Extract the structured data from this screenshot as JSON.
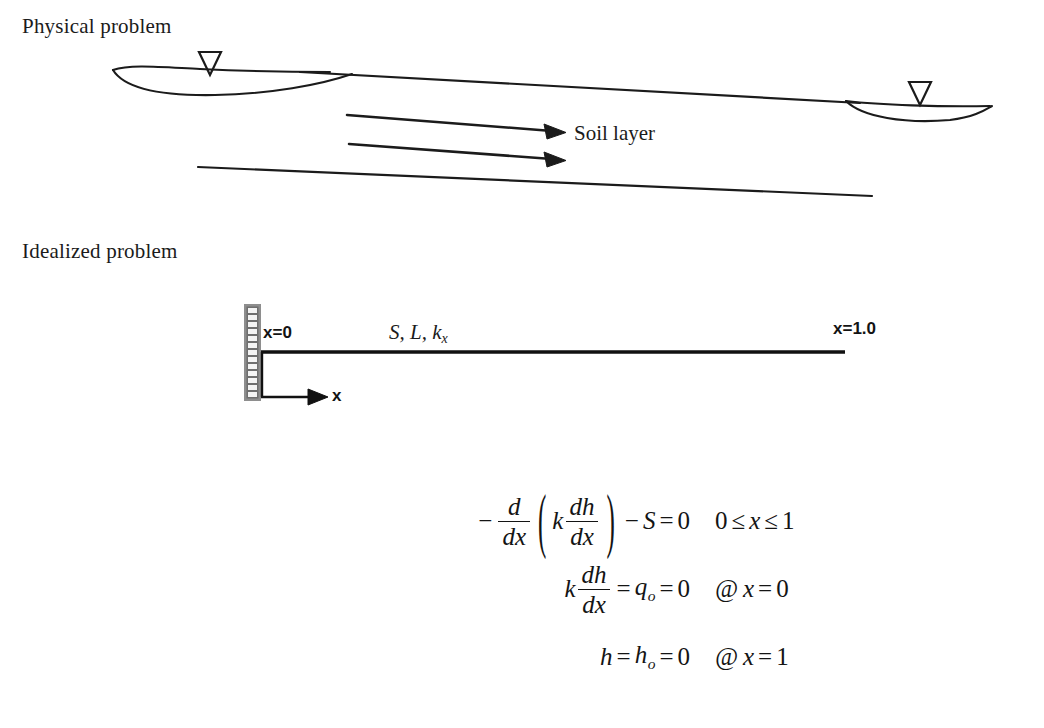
{
  "page": {
    "background": "#ffffff",
    "ink": "#1b1b1b",
    "width": 1044,
    "height": 728
  },
  "sections": {
    "physical": {
      "title": "Physical problem",
      "soil_layer_label": "Soil layer",
      "water_table_icon_left": "water-table-icon",
      "water_table_icon_right": "water-table-icon",
      "flow_arrow_count": 2
    },
    "idealized": {
      "title": "Idealized problem",
      "left_boundary_label": "x=0",
      "right_boundary_label": "x=1.0",
      "axis_label": "x",
      "beam_properties": {
        "base": "S, L, k",
        "subscript": "x"
      },
      "wall_icon": "hatched-fixed-support-icon",
      "wall_cells": 13,
      "wall_color": "#8a8a8a",
      "wall_cell_color": "#f2f2f2"
    }
  },
  "equations": [
    {
      "id": "governing-equation",
      "parts": {
        "minus": "−",
        "frac1_num": "d",
        "frac1_den": "dx",
        "paren_open": "(",
        "k": "k",
        "frac2_num": "dh",
        "frac2_den": "dx",
        "paren_close": ")",
        "minus2": "−",
        "S": "S",
        "equals": "=",
        "zero": "0"
      },
      "condition": {
        "text": "0 ≤ x ≤ 1",
        "lower": "0",
        "le1": "≤",
        "var": "x",
        "le2": "≤",
        "upper": "1"
      }
    },
    {
      "id": "neumann-boundary-condition",
      "parts": {
        "k": "k",
        "frac_num": "dh",
        "frac_den": "dx",
        "equals1": "=",
        "q": "q",
        "q_sub": "o",
        "equals2": "=",
        "zero": "0"
      },
      "condition": {
        "at": "@",
        "var": "x",
        "equals": "=",
        "value": "0"
      }
    },
    {
      "id": "dirichlet-boundary-condition",
      "parts": {
        "h": "h",
        "equals1": "=",
        "h2": "h",
        "h_sub": "o",
        "equals2": "=",
        "zero": "0"
      },
      "condition": {
        "at": "@",
        "var": "x",
        "equals": "=",
        "value": "1"
      }
    }
  ]
}
